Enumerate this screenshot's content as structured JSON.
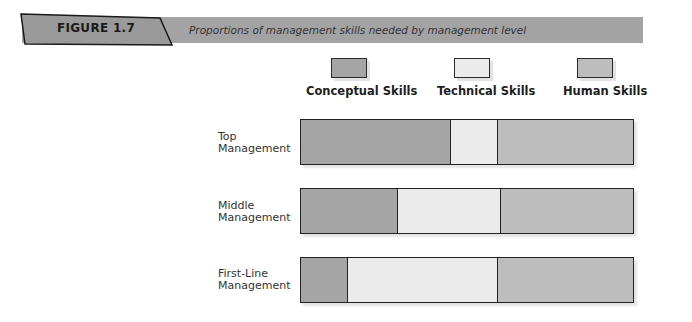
{
  "figure": {
    "label": "FIGURE 1.7",
    "caption": "Proportions of management skills needed by management level"
  },
  "colors": {
    "conceptual": "#a5a5a5",
    "technical": "#ebebeb",
    "human": "#bdbdbd",
    "band": "#a3a3a3"
  },
  "legend": [
    {
      "label": "Conceptual Skills",
      "color": "#a5a5a5"
    },
    {
      "label": "Technical Skills",
      "color": "#ebebeb"
    },
    {
      "label": "Human Skills",
      "color": "#bdbdbd"
    }
  ],
  "rows": [
    {
      "label_line1": "Top",
      "label_line2": "Management"
    },
    {
      "label_line1": "Middle",
      "label_line2": "Management"
    },
    {
      "label_line1": "First-Line",
      "label_line2": "Management"
    }
  ],
  "chart_data": {
    "type": "bar",
    "orientation": "horizontal",
    "stacked": true,
    "normalized": true,
    "title": "Proportions of management skills needed by management level",
    "categories": [
      "Top Management",
      "Middle Management",
      "First-Line Management"
    ],
    "series": [
      {
        "name": "Conceptual Skills",
        "color": "#a5a5a5",
        "values": [
          45,
          29,
          14
        ]
      },
      {
        "name": "Technical Skills",
        "color": "#ebebeb",
        "values": [
          14,
          31,
          45
        ]
      },
      {
        "name": "Human Skills",
        "color": "#bdbdbd",
        "values": [
          41,
          40,
          41
        ]
      }
    ],
    "xlabel": "",
    "ylabel": "",
    "xlim": [
      0,
      100
    ],
    "grid": false,
    "legend_position": "top"
  }
}
